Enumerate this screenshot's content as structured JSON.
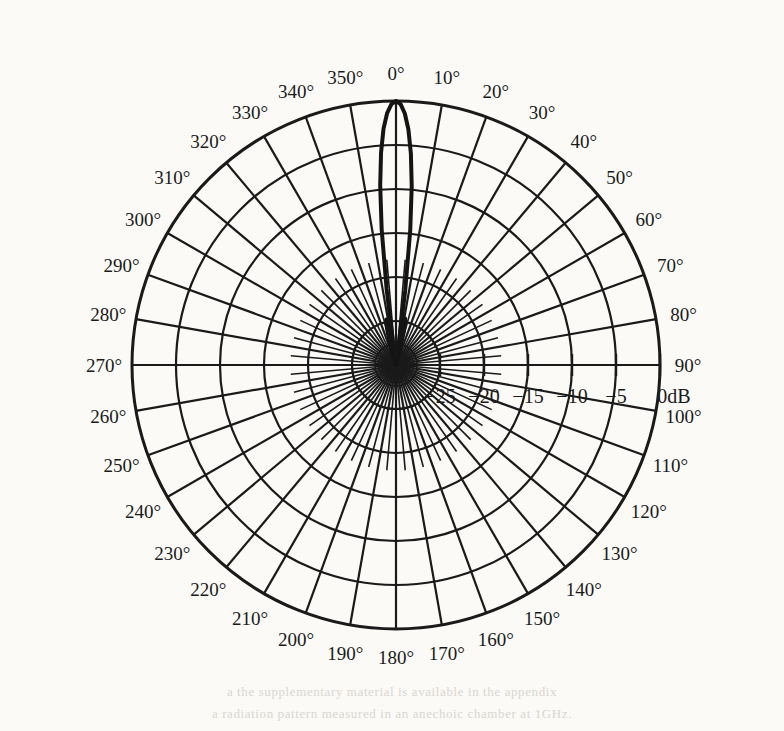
{
  "figure": {
    "kind": "polar-radiation-pattern",
    "background_color": "#fbfaf7",
    "ink_color": "#1a1a1a"
  },
  "bleed_through": {
    "line1": "a  the  supplementary  material  is  available  in  the  appendix",
    "line2": "a  radiation  pattern  measured  in  an  anechoic  chamber  at  1GHz."
  },
  "chart_data": {
    "type": "line",
    "subtype": "polar",
    "title": "",
    "xlabel": "",
    "ylabel": "",
    "angle_unit": "degrees",
    "angle_direction": "clockwise",
    "angle_zero_at": "top",
    "grid": true,
    "legend": null,
    "theta_tick_step": 10,
    "theta_ticks": [
      0,
      10,
      20,
      30,
      40,
      50,
      60,
      70,
      80,
      90,
      100,
      110,
      120,
      130,
      140,
      150,
      160,
      170,
      180,
      190,
      200,
      210,
      220,
      230,
      240,
      250,
      260,
      270,
      280,
      290,
      300,
      310,
      320,
      330,
      340,
      350
    ],
    "theta_tick_labels": [
      "0°",
      "10°",
      "20°",
      "30°",
      "40°",
      "50°",
      "60°",
      "70°",
      "80°",
      "90°",
      "100°",
      "110°",
      "120°",
      "130°",
      "140°",
      "150°",
      "160°",
      "170°",
      "180°",
      "190°",
      "200°",
      "210°",
      "220°",
      "230°",
      "240°",
      "250°",
      "260°",
      "270°",
      "280°",
      "290°",
      "300°",
      "310°",
      "320°",
      "330°",
      "340°",
      "350°"
    ],
    "rlim": [
      -30,
      0
    ],
    "r_unit": "dB",
    "r_ticks": [
      -25,
      -20,
      -15,
      -10,
      -5,
      0
    ],
    "r_tick_labels": [
      "−25",
      "−20",
      "−15",
      "−10",
      "−5",
      "0dB"
    ],
    "r_grid_rings": [
      -25,
      -20,
      -15,
      -10,
      -5,
      0
    ],
    "peak": {
      "angle": 0,
      "value_db": 0
    },
    "series": [
      {
        "name": "pattern",
        "color": "#141414",
        "line_width": 4,
        "values_db": [
          0.0,
          -0.35,
          -1.4,
          -3.2,
          -5.9,
          -9.6,
          -14.6,
          -21.5,
          -28.5,
          -27.0,
          -25.2,
          -24.6,
          -25.0,
          -26.2,
          -28.0,
          -29.2,
          -30.0,
          -30.0,
          -30.0,
          -30.0,
          -30.0,
          -30.0,
          -30.0,
          -30.0,
          -30.0,
          -30.0,
          -30.0,
          -30.0,
          -30.0,
          -30.0,
          -30.0,
          -30.0,
          -30.0,
          -30.0,
          -30.0,
          -30.0,
          -30.0,
          -30.0,
          -30.0,
          -30.0,
          -30.0,
          -30.0,
          -30.0,
          -30.0,
          -30.0,
          -30.0,
          -30.0,
          -30.0,
          -30.0,
          -30.0,
          -30.0,
          -30.0,
          -30.0,
          -30.0,
          -30.0,
          -30.0,
          -30.0,
          -30.0,
          -30.0,
          -30.0,
          -30.0,
          -30.0,
          -30.0,
          -30.0,
          -30.0,
          -30.0,
          -30.0,
          -30.0,
          -30.0,
          -30.0,
          -30.0,
          -30.0,
          -30.0,
          -30.0,
          -30.0,
          -30.0,
          -30.0,
          -30.0,
          -30.0,
          -30.0,
          -30.0,
          -30.0,
          -30.0,
          -30.0,
          -30.0,
          -30.0,
          -30.0,
          -30.0,
          -30.0,
          -30.0,
          -30.0,
          -30.0,
          -30.0,
          -30.0,
          -30.0,
          -30.0,
          -30.0,
          -30.0,
          -30.0,
          -30.0,
          -30.0,
          -30.0,
          -30.0,
          -30.0,
          -30.0,
          -30.0,
          -30.0,
          -30.0,
          -30.0,
          -30.0,
          -30.0,
          -30.0,
          -30.0,
          -30.0,
          -30.0,
          -30.0,
          -30.0,
          -30.0,
          -30.0,
          -30.0,
          -30.0,
          -30.0,
          -30.0,
          -30.0,
          -30.0,
          -30.0,
          -30.0,
          -30.0,
          -30.0,
          -30.0,
          -30.0,
          -30.0,
          -30.0,
          -30.0,
          -30.0,
          -30.0,
          -30.0,
          -30.0,
          -30.0,
          -30.0,
          -30.0,
          -30.0,
          -30.0,
          -30.0,
          -30.0,
          -30.0,
          -30.0,
          -30.0,
          -30.0,
          -30.0,
          -30.0,
          -30.0,
          -30.0,
          -30.0,
          -30.0,
          -30.0,
          -30.0,
          -30.0,
          -30.0,
          -30.0,
          -30.0,
          -30.0,
          -30.0,
          -30.0,
          -30.0,
          -30.0,
          -30.0,
          -30.0,
          -30.0,
          -30.0,
          -30.0,
          -30.0,
          -30.0,
          -30.0,
          -30.0,
          -30.0,
          -30.0,
          -30.0,
          -30.0,
          -30.0,
          -30.0,
          -30.0,
          -30.0,
          -30.0,
          -30.0,
          -30.0,
          -30.0,
          -30.0,
          -30.0,
          -30.0,
          -30.0,
          -30.0,
          -30.0,
          -30.0,
          -30.0,
          -30.0,
          -30.0,
          -30.0,
          -30.0,
          -30.0,
          -30.0,
          -30.0,
          -30.0,
          -30.0,
          -30.0,
          -30.0,
          -30.0,
          -30.0,
          -30.0,
          -30.0,
          -30.0,
          -30.0,
          -30.0,
          -30.0,
          -30.0,
          -30.0,
          -30.0,
          -30.0,
          -30.0,
          -30.0,
          -30.0,
          -30.0,
          -30.0,
          -30.0,
          -30.0,
          -30.0,
          -30.0,
          -30.0,
          -30.0,
          -30.0,
          -30.0,
          -30.0,
          -30.0,
          -30.0,
          -30.0,
          -30.0,
          -30.0,
          -30.0,
          -30.0,
          -30.0,
          -30.0,
          -30.0,
          -30.0,
          -30.0,
          -30.0,
          -30.0,
          -30.0,
          -30.0,
          -30.0,
          -30.0,
          -30.0,
          -30.0,
          -30.0,
          -30.0,
          -30.0,
          -30.0,
          -30.0,
          -30.0,
          -30.0,
          -30.0,
          -30.0,
          -30.0,
          -30.0,
          -30.0,
          -30.0,
          -30.0,
          -30.0,
          -30.0,
          -30.0,
          -30.0,
          -30.0,
          -30.0,
          -30.0,
          -30.0,
          -30.0,
          -30.0,
          -30.0,
          -30.0,
          -30.0,
          -30.0,
          -30.0,
          -30.0,
          -30.0,
          -30.0,
          -30.0,
          -30.0,
          -30.0,
          -30.0,
          -30.0,
          -30.0,
          -30.0,
          -30.0,
          -30.0,
          -30.0,
          -30.0,
          -30.0,
          -30.0,
          -30.0,
          -30.0,
          -30.0,
          -30.0,
          -30.0,
          -30.0,
          -30.0,
          -30.0,
          -30.0,
          -30.0,
          -30.0,
          -30.0,
          -30.0,
          -30.0,
          -30.0,
          -30.0,
          -30.0,
          -30.0,
          -30.0,
          -30.0,
          -30.0,
          -30.0,
          -30.0,
          -30.0,
          -30.0,
          -30.0,
          -30.0,
          -30.0,
          -30.0,
          -30.0,
          -30.0,
          -30.0,
          -30.0,
          -30.0,
          -30.0,
          -30.0,
          -30.0,
          -30.0,
          -30.0,
          -30.0,
          -30.0,
          -30.0,
          -30.0,
          -30.0,
          -29.4,
          -28.4,
          -27.2,
          -26.0,
          -25.1,
          -24.7,
          -25.0,
          -26.3,
          -28.4,
          -28.2,
          -21.3,
          -14.5,
          -9.5,
          -5.8,
          -3.1,
          -1.35,
          -0.35
        ]
      }
    ],
    "geometry": {
      "center_x": 396,
      "center_y": 365,
      "outer_radius": 264,
      "label_radius": 292
    }
  }
}
